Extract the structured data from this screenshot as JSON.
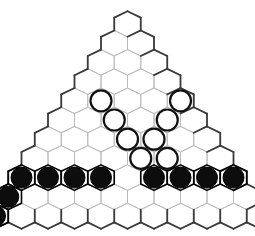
{
  "board": {
    "name": "triangular-hex-board",
    "shape": "triangle",
    "rows": 11,
    "orientation": "pointy-top",
    "cell_width": 26.5,
    "cell_height": 25.5,
    "row_pitch": 19.2,
    "origin_x": 127.5,
    "origin_y": 24.0,
    "colors": {
      "background": "#ffffff",
      "grid_line": "#b9b9b9",
      "edge_line": "#3a3a3a",
      "black_stone_fill": "#0d0d0d",
      "black_stone_stroke": "#000000",
      "white_stone_fill": "#ffffff",
      "white_stone_stroke": "#111111"
    },
    "grid_line_width": 0.9,
    "edge_line_width": 1.8,
    "stone_radius": 10.5,
    "white_stone_stroke_width": 2.2
  },
  "stones": {
    "black_label": "black",
    "white_label": "white",
    "black": [
      {
        "row": 9,
        "col": 0
      },
      {
        "row": 9,
        "col": 1
      },
      {
        "row": 9,
        "col": 2
      },
      {
        "row": 9,
        "col": 3
      },
      {
        "row": 9,
        "col": 5
      },
      {
        "row": 9,
        "col": 6
      },
      {
        "row": 9,
        "col": 7
      },
      {
        "row": 9,
        "col": 8
      },
      {
        "row": 10,
        "col": 0
      },
      {
        "row": 11,
        "col": 0
      }
    ],
    "white": [
      {
        "row": 5,
        "col": 1
      },
      {
        "row": 6,
        "col": 2
      },
      {
        "row": 7,
        "col": 3
      },
      {
        "row": 8,
        "col": 4
      },
      {
        "row": 5,
        "col": 4
      },
      {
        "row": 6,
        "col": 4
      },
      {
        "row": 7,
        "col": 4
      },
      {
        "row": 8,
        "col": 5
      },
      {
        "row": 11,
        "col": 11
      }
    ]
  },
  "counts": {
    "black_stones": 10,
    "white_stones": 9,
    "total_cells": 78
  }
}
